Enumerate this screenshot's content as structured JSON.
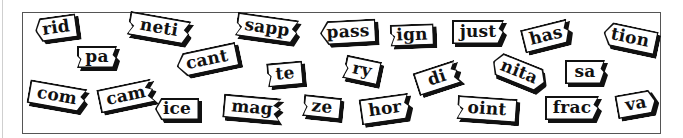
{
  "puzzle": {
    "title": "",
    "tiles": [
      {
        "text": "rid",
        "x": 35,
        "y": 16,
        "w": 42,
        "h": 24,
        "rot": -8,
        "shape": "s-lpoint"
      },
      {
        "text": "neti",
        "x": 128,
        "y": 16,
        "w": 62,
        "h": 24,
        "rot": 10,
        "shape": "s-ljag-rjag"
      },
      {
        "text": "sapp",
        "x": 236,
        "y": 16,
        "w": 62,
        "h": 24,
        "rot": 8,
        "shape": "s-ljag-rjag"
      },
      {
        "text": "pass",
        "x": 320,
        "y": 20,
        "w": 56,
        "h": 24,
        "rot": -3,
        "shape": "s-lpoint"
      },
      {
        "text": "ign",
        "x": 390,
        "y": 24,
        "w": 44,
        "h": 22,
        "rot": -2,
        "shape": "s-ljag"
      },
      {
        "text": "just",
        "x": 452,
        "y": 20,
        "w": 52,
        "h": 24,
        "rot": 0,
        "shape": "s-rjag"
      },
      {
        "text": "has",
        "x": 522,
        "y": 24,
        "w": 48,
        "h": 24,
        "rot": -14,
        "shape": "s-rjag"
      },
      {
        "text": "tion",
        "x": 603,
        "y": 26,
        "w": 54,
        "h": 24,
        "rot": 12,
        "shape": "s-lpoint"
      },
      {
        "text": "pa",
        "x": 77,
        "y": 46,
        "w": 40,
        "h": 22,
        "rot": 0,
        "shape": "s-ljag-rjag"
      },
      {
        "text": "cant",
        "x": 176,
        "y": 48,
        "w": 62,
        "h": 24,
        "rot": -12,
        "shape": "s-lpoint"
      },
      {
        "text": "te",
        "x": 267,
        "y": 62,
        "w": 36,
        "h": 24,
        "rot": -5,
        "shape": "s-ljag"
      },
      {
        "text": "ry",
        "x": 344,
        "y": 58,
        "w": 36,
        "h": 24,
        "rot": 12,
        "shape": "s-ljag"
      },
      {
        "text": "di",
        "x": 415,
        "y": 66,
        "w": 44,
        "h": 24,
        "rot": -18,
        "shape": "s-zig"
      },
      {
        "text": "nita",
        "x": 491,
        "y": 60,
        "w": 56,
        "h": 24,
        "rot": 22,
        "shape": "s-hex"
      },
      {
        "text": "sa",
        "x": 565,
        "y": 60,
        "w": 40,
        "h": 24,
        "rot": 0,
        "shape": "s-rjag"
      },
      {
        "text": "com",
        "x": 28,
        "y": 84,
        "w": 58,
        "h": 24,
        "rot": 10,
        "shape": "s-rjag"
      },
      {
        "text": "cam",
        "x": 98,
        "y": 84,
        "w": 56,
        "h": 24,
        "rot": -12,
        "shape": "s-zig"
      },
      {
        "text": "ice",
        "x": 155,
        "y": 98,
        "w": 44,
        "h": 22,
        "rot": 0,
        "shape": "s-lpoint"
      },
      {
        "text": "mag",
        "x": 223,
        "y": 96,
        "w": 58,
        "h": 24,
        "rot": 5,
        "shape": "s-zig"
      },
      {
        "text": "ze",
        "x": 303,
        "y": 96,
        "w": 38,
        "h": 22,
        "rot": 6,
        "shape": "s-ljag"
      },
      {
        "text": "hor",
        "x": 360,
        "y": 96,
        "w": 50,
        "h": 26,
        "rot": -8,
        "shape": "s-rjag"
      },
      {
        "text": "oint",
        "x": 457,
        "y": 97,
        "w": 60,
        "h": 24,
        "rot": 4,
        "shape": "s-ljag"
      },
      {
        "text": "frac",
        "x": 545,
        "y": 96,
        "w": 54,
        "h": 24,
        "rot": 0,
        "shape": "s-rjag"
      },
      {
        "text": "va",
        "x": 616,
        "y": 92,
        "w": 40,
        "h": 24,
        "rot": -10,
        "shape": "s-rpoint"
      }
    ]
  },
  "colors": {
    "tile_fill": "#ffffff",
    "tile_border": "#111111",
    "shadow": "#111111",
    "frame_border": "#555555",
    "background": "#ffffff"
  }
}
